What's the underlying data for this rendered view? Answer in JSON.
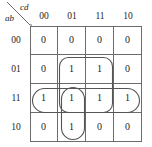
{
  "map": {
    "column_variables": "cd",
    "row_variables": "ab",
    "column_headers": [
      "00",
      "01",
      "11",
      "10"
    ],
    "row_headers": [
      "00",
      "01",
      "11",
      "10"
    ],
    "rows": [
      {
        "label": "00",
        "values": [
          "0",
          "0",
          "0",
          "0"
        ]
      },
      {
        "label": "01",
        "values": [
          "0",
          "1",
          "1",
          "0"
        ]
      },
      {
        "label": "11",
        "values": [
          "1",
          "1",
          "1",
          "1"
        ]
      },
      {
        "label": "10",
        "values": [
          "0",
          "1",
          "0",
          "0"
        ]
      }
    ],
    "groups": [
      {
        "name": "group-quad-rows01-11-cols01-11",
        "shape": "rounded-rect",
        "rows": [
          "01",
          "11"
        ],
        "columns": [
          "01",
          "11"
        ]
      },
      {
        "name": "group-row11-full",
        "shape": "oval",
        "rows": [
          "11"
        ],
        "columns": [
          "00",
          "01",
          "11",
          "10"
        ]
      },
      {
        "name": "group-col01-rows11-10",
        "shape": "oval",
        "rows": [
          "11",
          "10"
        ],
        "columns": [
          "01"
        ]
      }
    ],
    "colors": {
      "grid_line": "#6b6b6b",
      "loop_line": "#555555",
      "text": "#1c1c1c",
      "background": "#ffffff"
    }
  }
}
